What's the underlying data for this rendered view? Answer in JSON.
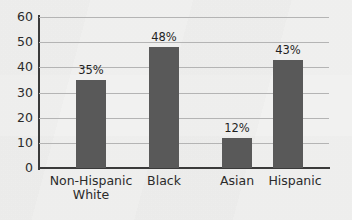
{
  "chart_data": {
    "type": "bar",
    "title": "",
    "subtitle": "",
    "xlabel": "",
    "ylabel": "",
    "categories": [
      "Non-Hispanic\nWhite",
      "Black",
      "Asian",
      "Hispanic"
    ],
    "values": [
      35,
      48,
      12,
      43
    ],
    "data_labels": [
      "35%",
      "48%",
      "12%",
      "43%"
    ],
    "ylim": [
      0,
      60
    ],
    "ytick_labels": [
      "60",
      "50",
      "40",
      "30",
      "20",
      "10",
      "0"
    ],
    "ytick_values": [
      60,
      50,
      40,
      30,
      20,
      10,
      0
    ],
    "grid": true,
    "grid_orientation": "horizontal",
    "legend": false,
    "legend_position": "none",
    "colors": {
      "bar": "#595959",
      "background": "#f1f1f0",
      "gridline": "#b4b4b4",
      "axis": "#3a3a3a",
      "text": "#2b2b2b"
    }
  }
}
